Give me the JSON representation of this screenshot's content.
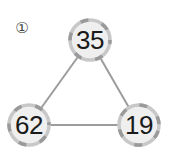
{
  "problem": {
    "number_label": "①"
  },
  "diagram": {
    "nodes": [
      {
        "id": "top",
        "value": "35",
        "cx": 90,
        "cy": 40
      },
      {
        "id": "bottom-left",
        "value": "62",
        "cx": 29,
        "cy": 125
      },
      {
        "id": "bottom-right",
        "value": "19",
        "cx": 139,
        "cy": 125
      }
    ],
    "edges": [
      [
        "top",
        "bottom-left"
      ],
      [
        "top",
        "bottom-right"
      ],
      [
        "bottom-left",
        "bottom-right"
      ]
    ],
    "colors": {
      "node_fill": "#efefef",
      "node_border": "#c4c4c4",
      "node_border_dark": "#9a9a9a",
      "edge": "#9c9c9c",
      "text": "#1a1a1a"
    }
  }
}
